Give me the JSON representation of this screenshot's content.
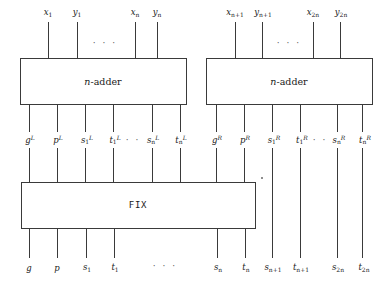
{
  "diagram": {
    "stroke_color": "#3a3a3a",
    "background": "#ffffff",
    "boxes": [
      {
        "id": "left-adder",
        "label_prefix": "n",
        "label_suffix": "-adder",
        "x": 20,
        "y": 58,
        "w": 166,
        "h": 46
      },
      {
        "id": "right-adder",
        "label_prefix": "n",
        "label_suffix": "-adder",
        "x": 206,
        "y": 58,
        "w": 166,
        "h": 46
      },
      {
        "id": "fix",
        "label": "FIX",
        "x": 21,
        "y": 182,
        "w": 234,
        "h": 46
      }
    ],
    "top_inputs_left": [
      {
        "base": "x",
        "sub": "1",
        "x": 48
      },
      {
        "base": "y",
        "sub": "1",
        "x": 77
      },
      {
        "base": "x",
        "sub": "n",
        "x": 135
      },
      {
        "base": "y",
        "sub": "n",
        "x": 157
      }
    ],
    "top_inputs_right": [
      {
        "base": "x",
        "sub": "n+1",
        "x": 235
      },
      {
        "base": "y",
        "sub": "n+1",
        "x": 262
      },
      {
        "base": "x",
        "sub": "2n",
        "x": 313
      },
      {
        "base": "y",
        "sub": "2n",
        "x": 340
      }
    ],
    "mid_outputs_left": [
      {
        "base": "g",
        "sub": "",
        "sup": "L",
        "x": 29
      },
      {
        "base": "p",
        "sub": "",
        "sup": "L",
        "x": 57
      },
      {
        "base": "s",
        "sub": "1",
        "sup": "L",
        "x": 85
      },
      {
        "base": "t",
        "sub": "1",
        "sup": "L",
        "x": 113
      },
      {
        "base": "s",
        "sub": "n",
        "sup": "L",
        "x": 152
      },
      {
        "base": "t",
        "sub": "n",
        "sup": "L",
        "x": 180
      }
    ],
    "mid_outputs_right": [
      {
        "base": "g",
        "sub": "",
        "sup": "R",
        "x": 216
      },
      {
        "base": "p",
        "sub": "",
        "sup": "R",
        "x": 244
      },
      {
        "base": "s",
        "sub": "1",
        "sup": "R",
        "x": 272
      },
      {
        "base": "t",
        "sub": "1",
        "sup": "R",
        "x": 300
      },
      {
        "base": "s",
        "sub": "n",
        "sup": "R",
        "x": 337
      },
      {
        "base": "t",
        "sub": "n",
        "sup": "R",
        "x": 362
      }
    ],
    "bottom_outputs": [
      {
        "base": "g",
        "sub": "",
        "x": 29
      },
      {
        "base": "p",
        "sub": "",
        "x": 57
      },
      {
        "base": "s",
        "sub": "1",
        "x": 86
      },
      {
        "base": "t",
        "sub": "1",
        "x": 114
      },
      {
        "base": "s",
        "sub": "n",
        "x": 217
      },
      {
        "base": "t",
        "sub": "n",
        "x": 245
      },
      {
        "base": "s",
        "sub": "n+1",
        "x": 272
      },
      {
        "base": "t",
        "sub": "n+1",
        "x": 300
      },
      {
        "base": "s",
        "sub": "2n",
        "x": 337
      },
      {
        "base": "t",
        "sub": "2n",
        "x": 362
      }
    ],
    "ellipses": [
      {
        "id": "top-left-ellipsis",
        "text": "· · ·",
        "x": 105,
        "y": 43
      },
      {
        "id": "top-right-ellipsis",
        "text": "· · ·",
        "x": 289,
        "y": 43
      },
      {
        "id": "mid-left-ellipsis",
        "text": "· ·",
        "x": 131,
        "y": 140
      },
      {
        "id": "mid-right-ellipsis",
        "text": "· ·",
        "x": 318,
        "y": 140
      },
      {
        "id": "bottom-ellipsis",
        "text": "· · ·",
        "x": 165,
        "y": 265
      }
    ]
  }
}
